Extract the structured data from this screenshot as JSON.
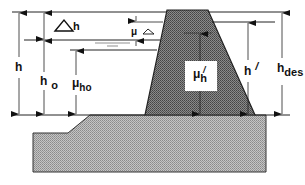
{
  "diagram": {
    "type": "dam cross-section (breakwater / embankment freeboard definitions)",
    "colors": {
      "line": "#222222",
      "dam_fill": "#6e6e6e",
      "foundation_fill": "#a8a8a8",
      "label_box": "#ffffff"
    },
    "labels": {
      "delta_h": {
        "main": "h",
        "symbol": "△"
      },
      "mu_delta": {
        "main": "μ",
        "sub": "△"
      },
      "h": {
        "main": "h"
      },
      "h0": {
        "main": "h",
        "sub": "o"
      },
      "mu_h0": {
        "main": "μ",
        "sub": "ho"
      },
      "mu_h_prime": {
        "main": "μ",
        "sub": "h",
        "sup": "/"
      },
      "h_prime": {
        "main": "h",
        "sup": "/"
      },
      "h_des": {
        "main": "h",
        "sub": "des"
      }
    }
  }
}
